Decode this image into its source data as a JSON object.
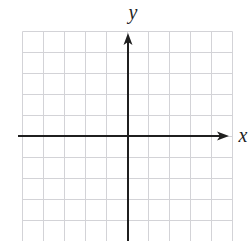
{
  "figure": {
    "x_axis_label": "x",
    "y_axis_label": "y"
  },
  "chart_data": {
    "type": "scatter",
    "title": "",
    "xlabel": "x",
    "ylabel": "y",
    "series": [],
    "points": [],
    "grid": true,
    "xlim": [
      -5,
      5
    ],
    "ylim": [
      -5,
      5
    ],
    "grid_cols": 10,
    "grid_rows": 10,
    "legend": "none",
    "colors": {
      "background": "#ffffff",
      "grid_line": "#d3d3d7",
      "axis": "#1f1f1f",
      "label": "#1f1f1f"
    },
    "layout": {
      "canvas_w": 249,
      "canvas_h": 241,
      "grid_left": 22.5,
      "grid_top": 31.5,
      "cell": 21,
      "cols": 10,
      "rows": 10,
      "origin_x": 128,
      "origin_y": 136,
      "x_axis_start": 18,
      "x_axis_tip": 229,
      "y_axis_tip": 33,
      "y_axis_bottom": 241,
      "x_label_x": 243,
      "x_label_y": 142,
      "y_label_x": 133,
      "y_label_y": 19
    }
  }
}
